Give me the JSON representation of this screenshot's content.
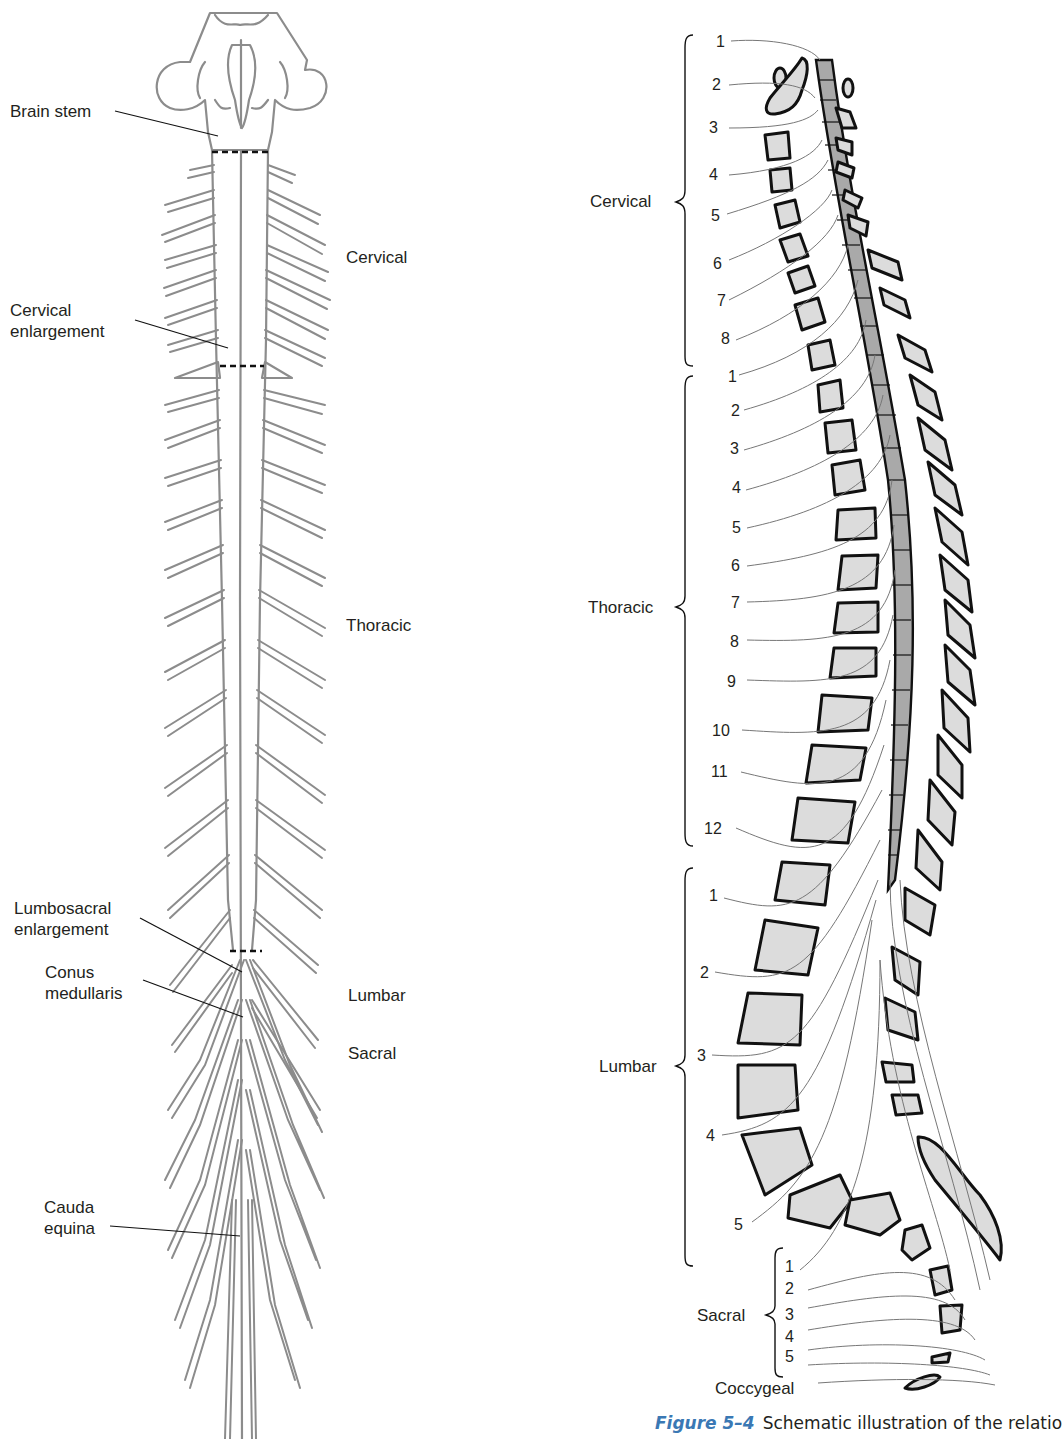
{
  "left_figure": {
    "title": "Spinal cord with nerve roots (dorsal view)",
    "labels": {
      "brain_stem": "Brain stem",
      "cervical_enlargement_1": "Cervical",
      "cervical_enlargement_2": "enlargement",
      "lumbosacral_enlargement_1": "Lumbosacral",
      "lumbosacral_enlargement_2": "enlargement",
      "conus_medullaris_1": "Conus",
      "conus_medullaris_2": "medullaris",
      "cauda_equina_1": "Cauda",
      "cauda_equina_2": "equina"
    },
    "regions": {
      "cervical": "Cervical",
      "thoracic": "Thoracic",
      "lumbar": "Lumbar",
      "sacral": "Sacral"
    }
  },
  "right_figure": {
    "groups": {
      "cervical": {
        "label": "Cervical",
        "numbers": [
          "1",
          "2",
          "3",
          "4",
          "5",
          "6",
          "7",
          "8"
        ]
      },
      "thoracic": {
        "label": "Thoracic",
        "numbers": [
          "1",
          "2",
          "3",
          "4",
          "5",
          "6",
          "7",
          "8",
          "9",
          "10",
          "11",
          "12"
        ]
      },
      "lumbar": {
        "label": "Lumbar",
        "numbers": [
          "1",
          "2",
          "3",
          "4",
          "5"
        ]
      },
      "sacral": {
        "label": "Sacral",
        "numbers": [
          "1",
          "2",
          "3",
          "4",
          "5"
        ]
      },
      "coccygeal": {
        "label": "Coccygeal"
      }
    }
  },
  "caption": {
    "figure_number": "Figure 5–4",
    "text": "Schematic illustration of the relatio"
  },
  "colors": {
    "nerve_gray": "#8c8c8c",
    "bone_fill": "#dcdcdc",
    "cord_fill": "#a9a9a9",
    "outline": "#111111",
    "caption_blue": "#3a78b4"
  }
}
